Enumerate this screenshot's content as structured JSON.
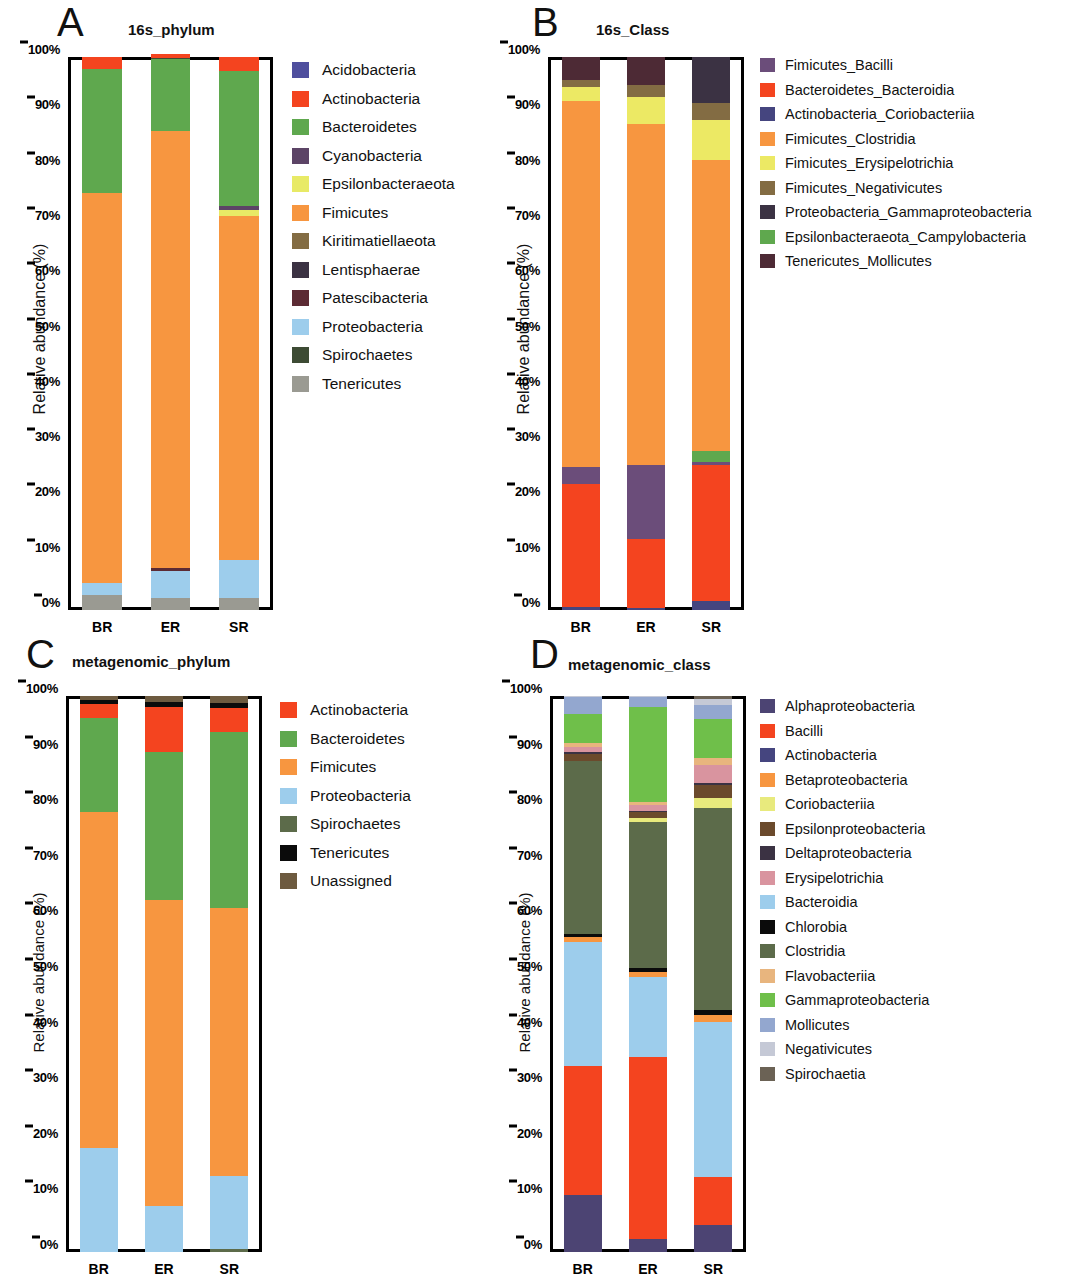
{
  "figure": {
    "y_axis_title": "Relative abundance (%)",
    "y_ticks": [
      "0%",
      "10%",
      "20%",
      "30%",
      "40%",
      "50%",
      "60%",
      "70%",
      "80%",
      "90%",
      "100%"
    ],
    "groups": [
      "BR",
      "ER",
      "SR"
    ]
  },
  "panels": [
    {
      "letter": "A",
      "title": "16s_phylum",
      "legend": [
        {
          "label": "Acidobacteria",
          "color": "#4f4f9e"
        },
        {
          "label": "Actinobacteria",
          "color": "#f4441f"
        },
        {
          "label": "Bacteroidetes",
          "color": "#5fa84e"
        },
        {
          "label": "Cyanobacteria",
          "color": "#5c4466"
        },
        {
          "label": "Epsilonbacteraeota",
          "color": "#e8ea66"
        },
        {
          "label": "Fimicutes",
          "color": "#f79640"
        },
        {
          "label": "Kiritimatiellaeota",
          "color": "#836c43"
        },
        {
          "label": "Lentisphaerae",
          "color": "#3b3243"
        },
        {
          "label": "Patescibacteria",
          "color": "#5c2b34"
        },
        {
          "label": "Proteobacteria",
          "color": "#9dcdec"
        },
        {
          "label": "Spirochaetes",
          "color": "#3d4b34"
        },
        {
          "label": "Tenericutes",
          "color": "#9a9a92"
        }
      ]
    },
    {
      "letter": "B",
      "title": "16s_Class",
      "legend": [
        {
          "label": "Fimicutes_Bacilli",
          "color": "#6b4d7a"
        },
        {
          "label": "Bacteroidetes_Bacteroidia",
          "color": "#f4441f"
        },
        {
          "label": "Actinobacteria_Coriobacteriia",
          "color": "#45457f"
        },
        {
          "label": "Fimicutes_Clostridia",
          "color": "#f79640"
        },
        {
          "label": "Fimicutes_Erysipelotrichia",
          "color": "#ece964"
        },
        {
          "label": "Fimicutes_Negativicutes",
          "color": "#836c43"
        },
        {
          "label": "Proteobacteria_Gammaproteobacteria",
          "color": "#3b3243"
        },
        {
          "label": "Epsilonbacteraeota_Campylobacteria",
          "color": "#5fa84e"
        },
        {
          "label": "Tenericutes_Mollicutes",
          "color": "#4d2a35"
        }
      ]
    },
    {
      "letter": "C",
      "title": "metagenomic_phylum",
      "legend": [
        {
          "label": "Actinobacteria",
          "color": "#f4441f"
        },
        {
          "label": "Bacteroidetes",
          "color": "#5fa84e"
        },
        {
          "label": "Fimicutes",
          "color": "#f79640"
        },
        {
          "label": "Proteobacteria",
          "color": "#9dcdec"
        },
        {
          "label": "Spirochaetes",
          "color": "#5c6b4a"
        },
        {
          "label": "Tenericutes",
          "color": "#0b0b0b"
        },
        {
          "label": "Unassigned",
          "color": "#6d5a3f"
        }
      ]
    },
    {
      "letter": "D",
      "title": "metagenomic_class",
      "legend": [
        {
          "label": "Alphaproteobacteria",
          "color": "#4c4473"
        },
        {
          "label": "Bacilli",
          "color": "#f4441f"
        },
        {
          "label": "Actinobacteria",
          "color": "#45457f"
        },
        {
          "label": "Betaproteobacteria",
          "color": "#f79640"
        },
        {
          "label": "Coriobacteriia",
          "color": "#e8ea7d"
        },
        {
          "label": "Epsilonproteobacteria",
          "color": "#6b4a2c"
        },
        {
          "label": "Deltaproteobacteria",
          "color": "#3b3243"
        },
        {
          "label": "Erysipelotrichia",
          "color": "#d9949f"
        },
        {
          "label": "Bacteroidia",
          "color": "#9dcdec"
        },
        {
          "label": "Chlorobia",
          "color": "#0b0b0b"
        },
        {
          "label": "Clostridia",
          "color": "#5c6b4a"
        },
        {
          "label": "Flavobacteriia",
          "color": "#e8b57e"
        },
        {
          "label": "Gammaproteobacteria",
          "color": "#6fbf4a"
        },
        {
          "label": "Mollicutes",
          "color": "#93a7cf"
        },
        {
          "label": "Negativicutes",
          "color": "#c5c9d6"
        },
        {
          "label": "Spirochaetia",
          "color": "#6b6255"
        }
      ]
    }
  ],
  "chart_data": [
    {
      "type": "bar",
      "stacked": true,
      "panel": "A",
      "title": "16s_phylum",
      "xlabel": "",
      "ylabel": "Relative abundance (%)",
      "ylim": [
        0,
        100
      ],
      "grid": false,
      "legend_position": "right",
      "categories": [
        "BR",
        "ER",
        "SR"
      ],
      "series": [
        {
          "name": "Tenericutes",
          "color": "#9a9a92",
          "values": [
            2.8,
            2.2,
            2.1
          ]
        },
        {
          "name": "Proteobacteria",
          "color": "#9dcdec",
          "values": [
            2.1,
            4.9,
            6.9
          ]
        },
        {
          "name": "Patescibacteria",
          "color": "#5c2b34",
          "values": [
            0.0,
            0.5,
            0.0
          ]
        },
        {
          "name": "Fimicutes",
          "color": "#f79640",
          "values": [
            70.6,
            79.0,
            62.2
          ]
        },
        {
          "name": "Epsilonbacteraeota",
          "color": "#e8ea66",
          "values": [
            0.0,
            0.0,
            1.2
          ]
        },
        {
          "name": "Cyanobacteria",
          "color": "#5c4466",
          "values": [
            0.0,
            0.0,
            0.6
          ]
        },
        {
          "name": "Bacteroidetes",
          "color": "#5fa84e",
          "values": [
            22.3,
            13.0,
            24.5
          ]
        },
        {
          "name": "Spirochaetes",
          "color": "#3d4b34",
          "values": [
            0.0,
            0.3,
            0.0
          ]
        },
        {
          "name": "Actinobacteria",
          "color": "#f4441f",
          "values": [
            2.2,
            0.6,
            2.5
          ]
        },
        {
          "name": "Acidobacteria",
          "color": "#4f4f9e",
          "values": [
            0.0,
            0.0,
            0.0
          ]
        }
      ]
    },
    {
      "type": "bar",
      "stacked": true,
      "panel": "B",
      "title": "16s_Class",
      "xlabel": "",
      "ylabel": "Relative abundance (%)",
      "ylim": [
        0,
        100
      ],
      "grid": false,
      "legend_position": "right",
      "categories": [
        "BR",
        "ER",
        "SR"
      ],
      "series": [
        {
          "name": "Actinobacteria_Coriobacteriia",
          "color": "#45457f",
          "values": [
            0.5,
            0.4,
            1.6
          ]
        },
        {
          "name": "Bacteroidetes_Bacteroidia",
          "color": "#f4441f",
          "values": [
            22.3,
            12.4,
            24.6
          ]
        },
        {
          "name": "Fimicutes_Bacilli",
          "color": "#6b4d7a",
          "values": [
            3.1,
            13.4,
            0.6
          ]
        },
        {
          "name": "Epsilonbacteraeota_Campylobacteria",
          "color": "#5fa84e",
          "values": [
            0.0,
            0.0,
            1.9
          ]
        },
        {
          "name": "Fimicutes_Clostridia",
          "color": "#f79640",
          "values": [
            66.1,
            61.6,
            52.6
          ]
        },
        {
          "name": "Fimicutes_Erysipelotrichia",
          "color": "#ece964",
          "values": [
            2.6,
            4.9,
            7.3
          ]
        },
        {
          "name": "Fimicutes_Negativicutes",
          "color": "#836c43",
          "values": [
            1.3,
            2.3,
            3.0
          ]
        },
        {
          "name": "Proteobacteria_Gammaproteobacteria",
          "color": "#3b3243",
          "values": [
            0.0,
            0.0,
            8.4
          ]
        },
        {
          "name": "Tenericutes_Mollicutes",
          "color": "#4d2a35",
          "values": [
            4.1,
            5.0,
            0.0
          ]
        }
      ]
    },
    {
      "type": "bar",
      "stacked": true,
      "panel": "C",
      "title": "metagenomic_phylum",
      "xlabel": "",
      "ylabel": "Relative abundance (%)",
      "ylim": [
        0,
        100
      ],
      "grid": false,
      "legend_position": "right",
      "categories": [
        "BR",
        "ER",
        "SR"
      ],
      "series": [
        {
          "name": "Spirochaetes",
          "color": "#5c6b4a",
          "values": [
            0.0,
            0.0,
            0.5
          ]
        },
        {
          "name": "Proteobacteria",
          "color": "#9dcdec",
          "values": [
            18.7,
            8.2,
            13.1
          ]
        },
        {
          "name": "Fimicutes",
          "color": "#f79640",
          "values": [
            60.4,
            55.2,
            48.2
          ]
        },
        {
          "name": "Bacteroidetes",
          "color": "#5fa84e",
          "values": [
            16.9,
            26.5,
            31.8
          ]
        },
        {
          "name": "Actinobacteria",
          "color": "#f4441f",
          "values": [
            2.6,
            8.2,
            4.2
          ]
        },
        {
          "name": "Tenericutes",
          "color": "#0b0b0b",
          "values": [
            0.6,
            0.8,
            0.9
          ]
        },
        {
          "name": "Unassigned",
          "color": "#6d5a3f",
          "values": [
            0.8,
            1.1,
            1.3
          ]
        }
      ]
    },
    {
      "type": "bar",
      "stacked": true,
      "panel": "D",
      "title": "metagenomic_class",
      "xlabel": "",
      "ylabel": "Relative abundance (%)",
      "ylim": [
        0,
        100
      ],
      "grid": false,
      "legend_position": "right",
      "categories": [
        "BR",
        "ER",
        "SR"
      ],
      "series": [
        {
          "name": "Alphaproteobacteria",
          "color": "#4c4473",
          "values": [
            10.2,
            2.4,
            4.9
          ]
        },
        {
          "name": "Bacilli",
          "color": "#f4441f",
          "values": [
            23.3,
            32.6,
            8.6
          ]
        },
        {
          "name": "Bacteroidia",
          "color": "#9dcdec",
          "values": [
            22.3,
            14.5,
            27.9
          ]
        },
        {
          "name": "Betaproteobacteria",
          "color": "#f79640",
          "values": [
            0.8,
            0.9,
            1.3
          ]
        },
        {
          "name": "Chlorobia",
          "color": "#0b0b0b",
          "values": [
            0.6,
            0.6,
            0.9
          ]
        },
        {
          "name": "Clostridia",
          "color": "#5c6b4a",
          "values": [
            31.2,
            26.3,
            36.3
          ]
        },
        {
          "name": "Coriobacteriia",
          "color": "#e8ea7d",
          "values": [
            0.0,
            0.7,
            1.7
          ]
        },
        {
          "name": "Epsilonproteobacteria",
          "color": "#6b4a2c",
          "values": [
            1.2,
            1.1,
            2.4
          ]
        },
        {
          "name": "Deltaproteobacteria",
          "color": "#3b3243",
          "values": [
            0.4,
            0.3,
            0.4
          ]
        },
        {
          "name": "Erysipelotrichia",
          "color": "#d9949f",
          "values": [
            0.8,
            1.0,
            3.2
          ]
        },
        {
          "name": "Flavobacteriia",
          "color": "#e8b57e",
          "values": [
            0.7,
            0.6,
            1.2
          ]
        },
        {
          "name": "Gammaproteobacteria",
          "color": "#6fbf4a",
          "values": [
            5.3,
            17.0,
            7.1
          ]
        },
        {
          "name": "Mollicutes",
          "color": "#93a7cf",
          "values": [
            3.0,
            1.8,
            2.5
          ]
        },
        {
          "name": "Negativicutes",
          "color": "#c5c9d6",
          "values": [
            0.2,
            0.2,
            1.0
          ]
        },
        {
          "name": "Spirochaetia",
          "color": "#6b6255",
          "values": [
            0.0,
            0.0,
            0.6
          ]
        }
      ]
    }
  ]
}
